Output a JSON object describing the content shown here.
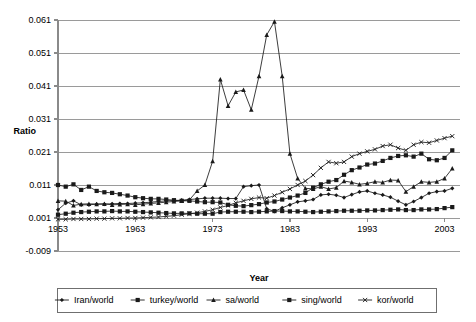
{
  "chart_data": {
    "type": "line",
    "title": "",
    "xlabel": "Year",
    "ylabel": "Ratio",
    "xlim": [
      1953,
      2005
    ],
    "ylim": [
      -0.009,
      0.061
    ],
    "xticks": [
      1953,
      1963,
      1973,
      1983,
      1993,
      2003
    ],
    "yticks": [
      -0.009,
      0.001,
      0.011,
      0.021,
      0.031,
      0.041,
      0.051,
      0.061
    ],
    "ytick_labels": [
      "-0.009",
      "0.001",
      "0.011",
      "0.021",
      "0.031",
      "0.041",
      "0.051",
      "0.061"
    ],
    "xtick_labels": [
      "1953",
      "1963",
      "1973",
      "1983",
      "1993",
      "2003"
    ],
    "grid": true,
    "legend_position": "bottom",
    "x": [
      1953,
      1954,
      1955,
      1956,
      1957,
      1958,
      1959,
      1960,
      1961,
      1962,
      1963,
      1964,
      1965,
      1966,
      1967,
      1968,
      1969,
      1970,
      1971,
      1972,
      1973,
      1974,
      1975,
      1976,
      1977,
      1978,
      1979,
      1980,
      1981,
      1982,
      1983,
      1984,
      1985,
      1986,
      1987,
      1988,
      1989,
      1990,
      1991,
      1992,
      1993,
      1994,
      1995,
      1996,
      1997,
      1998,
      1999,
      2000,
      2001,
      2002,
      2003,
      2004
    ],
    "series": [
      {
        "name": "Iran/world",
        "marker": "diamond",
        "values": [
          0.0035,
          0.0055,
          0.0062,
          0.005,
          0.005,
          0.0052,
          0.0052,
          0.0053,
          0.0054,
          0.0054,
          0.0055,
          0.0056,
          0.0058,
          0.006,
          0.0062,
          0.0063,
          0.0064,
          0.0066,
          0.0068,
          0.007,
          0.007,
          0.007,
          0.0069,
          0.0069,
          0.0105,
          0.0108,
          0.011,
          0.0038,
          0.003,
          0.0041,
          0.005,
          0.0059,
          0.0062,
          0.0066,
          0.008,
          0.0082,
          0.0079,
          0.0072,
          0.0081,
          0.0089,
          0.0092,
          0.0085,
          0.008,
          0.0073,
          0.0061,
          0.005,
          0.006,
          0.0072,
          0.0085,
          0.009,
          0.0092,
          0.01
        ]
      },
      {
        "name": "turkey/world",
        "marker": "square",
        "values": [
          0.011,
          0.0105,
          0.0112,
          0.0095,
          0.0105,
          0.0092,
          0.0088,
          0.0086,
          0.0082,
          0.0078,
          0.0073,
          0.007,
          0.0068,
          0.0068,
          0.0066,
          0.0064,
          0.0062,
          0.0062,
          0.006,
          0.0058,
          0.0058,
          0.0057,
          0.005,
          0.0047,
          0.0046,
          0.0049,
          0.0052,
          0.0057,
          0.006,
          0.0066,
          0.0072,
          0.0078,
          0.0086,
          0.0102,
          0.0112,
          0.012,
          0.0125,
          0.0141,
          0.0155,
          0.0163,
          0.0172,
          0.0175,
          0.0183,
          0.0192,
          0.0198,
          0.02,
          0.0196,
          0.0205,
          0.0188,
          0.0185,
          0.0192,
          0.0215
        ]
      },
      {
        "name": "sa/world",
        "marker": "triangle",
        "values": [
          0.0062,
          0.0061,
          0.0048,
          0.0052,
          0.0053,
          0.0052,
          0.0053,
          0.005,
          0.0051,
          0.0052,
          0.005,
          0.0052,
          0.0054,
          0.0056,
          0.0058,
          0.006,
          0.0062,
          0.0065,
          0.0092,
          0.011,
          0.0182,
          0.043,
          0.035,
          0.0392,
          0.0398,
          0.0338,
          0.044,
          0.0565,
          0.0605,
          0.044,
          0.0205,
          0.013,
          0.01,
          0.0098,
          0.0105,
          0.0098,
          0.0102,
          0.0122,
          0.0118,
          0.0112,
          0.0115,
          0.012,
          0.0118,
          0.0125,
          0.0124,
          0.009,
          0.0105,
          0.012,
          0.0118,
          0.012,
          0.013,
          0.016
        ]
      },
      {
        "name": "sing/world",
        "marker": "square",
        "values": [
          0.002,
          0.0023,
          0.0026,
          0.0028,
          0.0029,
          0.003,
          0.003,
          0.0031,
          0.003,
          0.003,
          0.0029,
          0.0028,
          0.0027,
          0.0026,
          0.0025,
          0.0024,
          0.0024,
          0.0024,
          0.0023,
          0.0023,
          0.0023,
          0.0028,
          0.0029,
          0.0029,
          0.0029,
          0.0028,
          0.0029,
          0.003,
          0.0031,
          0.0031,
          0.003,
          0.003,
          0.0029,
          0.0028,
          0.0029,
          0.003,
          0.0031,
          0.0032,
          0.0032,
          0.0032,
          0.0033,
          0.0033,
          0.0034,
          0.0035,
          0.0036,
          0.0034,
          0.0034,
          0.0036,
          0.0036,
          0.0037,
          0.004,
          0.0043
        ]
      },
      {
        "name": "kor/world",
        "marker": "x",
        "values": [
          0.0006,
          0.0006,
          0.0007,
          0.0007,
          0.0007,
          0.0008,
          0.0008,
          0.0009,
          0.0009,
          0.001,
          0.001,
          0.0011,
          0.0012,
          0.0013,
          0.0015,
          0.0017,
          0.002,
          0.0023,
          0.0026,
          0.003,
          0.0035,
          0.0042,
          0.0048,
          0.0056,
          0.0062,
          0.0068,
          0.0072,
          0.007,
          0.0078,
          0.0088,
          0.0098,
          0.011,
          0.0122,
          0.014,
          0.0162,
          0.018,
          0.0176,
          0.018,
          0.0196,
          0.0205,
          0.0212,
          0.0218,
          0.0228,
          0.0232,
          0.0222,
          0.0215,
          0.0232,
          0.024,
          0.0238,
          0.0245,
          0.0252,
          0.0258
        ]
      }
    ]
  },
  "legend": {
    "items": [
      {
        "label": "Iran/world"
      },
      {
        "label": "turkey/world"
      },
      {
        "label": "sa/world"
      },
      {
        "label": "sing/world"
      },
      {
        "label": "kor/world"
      }
    ]
  },
  "colors": {
    "series": "#1a1a1a",
    "grid": "#9a9a9a",
    "axis": "#8a8a8a",
    "text": "#000000",
    "background": "#ffffff"
  }
}
